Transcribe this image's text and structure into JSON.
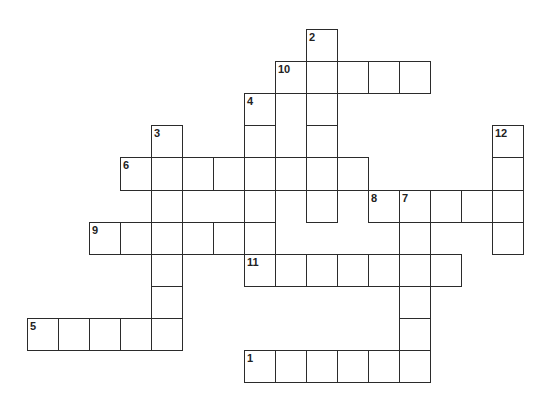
{
  "puzzle": {
    "type": "crossword",
    "colors": {
      "border": "#2b2b2b",
      "cell_bg": "#ffffff",
      "number": "#222222"
    },
    "words": [
      {
        "number": "1",
        "direction": "across",
        "row": 10,
        "col": 7,
        "length": 6
      },
      {
        "number": "2",
        "direction": "down",
        "row": 0,
        "col": 9,
        "length": 6
      },
      {
        "number": "3",
        "direction": "down",
        "row": 3,
        "col": 4,
        "length": 7
      },
      {
        "number": "4",
        "direction": "down",
        "row": 2,
        "col": 7,
        "length": 6
      },
      {
        "number": "5",
        "direction": "across",
        "row": 9,
        "col": 0,
        "length": 5
      },
      {
        "number": "6",
        "direction": "across",
        "row": 4,
        "col": 3,
        "length": 8
      },
      {
        "number": "7",
        "direction": "down",
        "row": 5,
        "col": 12,
        "length": 6
      },
      {
        "number": "8",
        "direction": "across",
        "row": 5,
        "col": 11,
        "length": 5
      },
      {
        "number": "9",
        "direction": "across",
        "row": 6,
        "col": 2,
        "length": 6
      },
      {
        "number": "10",
        "direction": "across",
        "row": 1,
        "col": 8,
        "length": 5
      },
      {
        "number": "11",
        "direction": "across",
        "row": 7,
        "col": 7,
        "length": 7
      },
      {
        "number": "12",
        "direction": "down",
        "row": 3,
        "col": 15,
        "length": 4
      }
    ]
  }
}
